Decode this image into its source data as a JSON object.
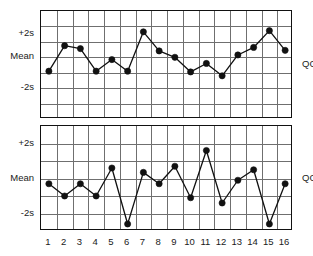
{
  "figure": {
    "clipped_title": "",
    "x_axis": {
      "label": "",
      "ticks": [
        "1",
        "2",
        "3",
        "4",
        "5",
        "6",
        "7",
        "8",
        "9",
        "10",
        "11",
        "12",
        "13",
        "14",
        "15",
        "16"
      ]
    },
    "y_axis": {
      "ticks": [
        "+2s",
        "Mean",
        "-2s"
      ]
    },
    "panel_labels": [
      "QC1",
      "QC2"
    ],
    "colors": {
      "line": "#111111",
      "marker": "#111111",
      "grid": "#6f6f6f",
      "frame": "#111111",
      "background": "#ffffff"
    }
  },
  "chart_data": [
    {
      "type": "line",
      "title": "QC1",
      "xlabel": "",
      "ylabel": "",
      "grid": true,
      "legend": "none",
      "ylim": [
        -3,
        3
      ],
      "ytick_values": [
        2,
        0,
        -2
      ],
      "ytick_labels": [
        "+2s",
        "Mean",
        "-2s"
      ],
      "categories": [
        "1",
        "2",
        "3",
        "4",
        "5",
        "6",
        "7",
        "8",
        "9",
        "10",
        "11",
        "12",
        "13",
        "14",
        "15",
        "16"
      ],
      "x": [
        1,
        2,
        3,
        4,
        5,
        6,
        7,
        8,
        9,
        10,
        11,
        12,
        13,
        14,
        15,
        16
      ],
      "values": [
        -0.9,
        1.0,
        0.75,
        -0.9,
        -0.15,
        -0.9,
        2.2,
        0.55,
        0.0,
        -0.95,
        -0.4,
        -1.2,
        0.2,
        0.85,
        2.3,
        0.6
      ],
      "units": "standard deviations from mean"
    },
    {
      "type": "line",
      "title": "QC2",
      "xlabel": "",
      "ylabel": "",
      "grid": true,
      "legend": "none",
      "ylim": [
        -3,
        3
      ],
      "ytick_values": [
        2,
        0,
        -2
      ],
      "ytick_labels": [
        "+2s",
        "Mean",
        "-2s"
      ],
      "categories": [
        "1",
        "2",
        "3",
        "4",
        "5",
        "6",
        "7",
        "8",
        "9",
        "10",
        "11",
        "12",
        "13",
        "14",
        "15",
        "16"
      ],
      "x": [
        1,
        2,
        3,
        4,
        5,
        6,
        7,
        8,
        9,
        10,
        11,
        12,
        13,
        14,
        15,
        16
      ],
      "values": [
        -0.3,
        -1.0,
        -0.3,
        -1.0,
        0.6,
        -2.6,
        0.35,
        -0.3,
        0.7,
        -1.1,
        1.6,
        -1.4,
        -0.1,
        0.5,
        -2.6,
        -0.3
      ],
      "units": "standard deviations from mean"
    }
  ]
}
